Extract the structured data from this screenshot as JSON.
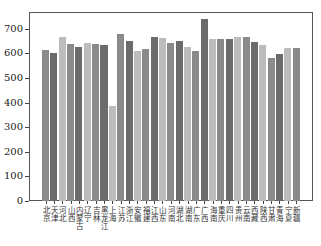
{
  "chart_data": {
    "type": "bar",
    "title": "",
    "xlabel": "",
    "ylabel": "",
    "ylim": [
      0,
      768
    ],
    "grid": false,
    "legend": null,
    "yticks": [
      0,
      100,
      200,
      300,
      400,
      500,
      600,
      700
    ],
    "categories": [
      "北京",
      "天津",
      "河北",
      "山西",
      "内蒙古",
      "辽宁",
      "吉林",
      "黑龙江",
      "上海",
      "江苏",
      "浙江",
      "安徽",
      "福建",
      "江西",
      "山东",
      "河南",
      "湖北",
      "湖南",
      "广东",
      "广西",
      "海南",
      "重庆",
      "四川",
      "贵州",
      "云南",
      "西藏",
      "陕西",
      "甘肃",
      "青海",
      "宁夏",
      "新疆"
    ],
    "values": [
      614,
      602,
      667,
      638,
      626,
      642,
      638,
      632,
      388,
      678,
      650,
      608,
      618,
      665,
      663,
      641,
      652,
      625,
      611,
      740,
      660,
      659,
      657,
      665,
      668,
      646,
      635,
      581,
      599,
      621,
      621
    ],
    "colors": [
      "#8a8a8a",
      "#6b6b6b",
      "#bcbcbc"
    ]
  }
}
